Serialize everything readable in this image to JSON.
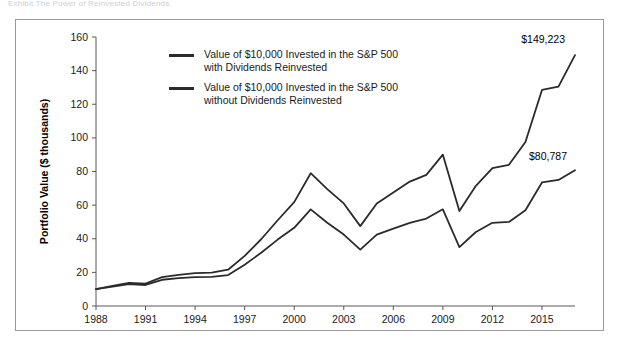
{
  "figure": {
    "top_sliver_text": "Exhibit  The Power of Reinvested Dividends",
    "frame_color": "#9a9a9a",
    "line_color": "#2b2b2f",
    "background": "#ffffff"
  },
  "legend": {
    "position": "inside-top-left",
    "items": [
      {
        "swatch_name": "legend-swatch-with-dividends",
        "label": "Value of $10,000 Invested in the S&P 500\nwith Dividends Reinvested"
      },
      {
        "swatch_name": "legend-swatch-without-dividends",
        "label": "Value of $10,000 Invested in the S&P 500\nwithout Dividends Reinvested"
      }
    ]
  },
  "annotations": [
    {
      "name": "annotation-with-dividends",
      "text": "$149,223"
    },
    {
      "name": "annotation-without-dividends",
      "text": "$80,787"
    }
  ],
  "chart_data": {
    "type": "line",
    "title": "",
    "subtitle": "",
    "xlabel": "",
    "ylabel": "Portfolio Value ($ thousands)",
    "xlim": [
      1988,
      2017
    ],
    "ylim": [
      0,
      160
    ],
    "ytick_values": [
      0,
      20,
      40,
      60,
      80,
      100,
      120,
      140,
      160
    ],
    "ytick_labels": [
      "0",
      "20",
      "40",
      "60",
      "80",
      "100",
      "120",
      "140",
      "160"
    ],
    "xtick_values": [
      1988,
      1991,
      1994,
      1997,
      2000,
      2003,
      2006,
      2009,
      2012,
      2015
    ],
    "xtick_labels": [
      "1988",
      "1991",
      "1994",
      "1997",
      "2000",
      "2003",
      "2006",
      "2009",
      "2012",
      "2015"
    ],
    "grid": false,
    "legend_position": "upper-left-inside",
    "x": [
      1988,
      1989,
      1990,
      1991,
      1992,
      1993,
      1994,
      1995,
      1996,
      1997,
      1998,
      1999,
      2000,
      2001,
      2002,
      2003,
      2004,
      2005,
      2006,
      2007,
      2008,
      2009,
      2010,
      2011,
      2012,
      2013,
      2014,
      2015,
      2016,
      2017
    ],
    "series": [
      {
        "name": "Value of $10,000 Invested in the S&P 500 with Dividends Reinvested",
        "end_label": "$149,223",
        "values": [
          10.0,
          12.0,
          13.8,
          13.3,
          17.2,
          18.5,
          19.6,
          19.8,
          21.6,
          29.8,
          39.7,
          51.0,
          61.8,
          79.0,
          69.5,
          61.0,
          47.5,
          61.0,
          67.5,
          74.0,
          78.0,
          90.0,
          56.5,
          71.5,
          82.0,
          84.0,
          97.5,
          128.5,
          130.5,
          149.2
        ]
      },
      {
        "name": "Value of $10,000 Invested in the S&P 500 without Dividends Reinvested",
        "end_label": "$80,787",
        "values": [
          10.0,
          11.5,
          13.0,
          12.5,
          15.6,
          16.6,
          17.2,
          17.3,
          18.4,
          24.5,
          31.7,
          39.5,
          46.5,
          57.5,
          49.5,
          42.5,
          33.5,
          42.5,
          46.0,
          49.5,
          52.0,
          57.5,
          35.0,
          44.0,
          49.5,
          50.0,
          57.0,
          73.5,
          75.0,
          80.8
        ]
      }
    ],
    "units": "thousands of dollars"
  }
}
